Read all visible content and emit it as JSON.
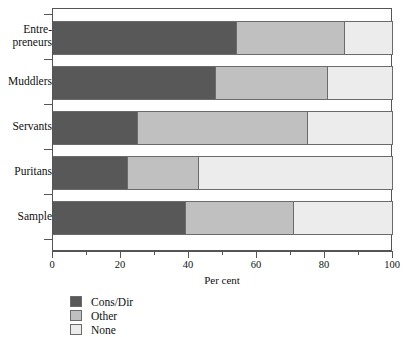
{
  "chart_data": {
    "type": "bar",
    "orientation": "horizontal",
    "stacked": true,
    "stacked_mode": "percent",
    "title": "",
    "xlabel": "Per cent",
    "ylabel": "",
    "xlim": [
      0,
      100
    ],
    "xticks": [
      0,
      20,
      40,
      60,
      80,
      100
    ],
    "xtick_labels": [
      "0",
      "20",
      "40",
      "60",
      "80",
      "100"
    ],
    "minor_xticks": [
      10,
      30,
      50,
      70,
      90
    ],
    "grid": false,
    "legend_position": "below-left",
    "categories": [
      "Entre-preneurs",
      "Muddlers",
      "Servants",
      "Puritans",
      "Sample"
    ],
    "series": [
      {
        "name": "Cons/Dir",
        "color": "#585858",
        "values": [
          54,
          48,
          25,
          22,
          39
        ]
      },
      {
        "name": "Other",
        "color": "#c0c0c0",
        "values": [
          32,
          33,
          50,
          21,
          32
        ]
      },
      {
        "name": "None",
        "color": "#ececec",
        "values": [
          14,
          19,
          25,
          57,
          29
        ]
      }
    ]
  },
  "axis": {
    "x_title": "Per cent",
    "tick_labels": [
      "0",
      "20",
      "40",
      "60",
      "80",
      "100"
    ]
  },
  "categories": [
    {
      "line1": "Entre-",
      "line2": "preneurs"
    },
    {
      "line1": "Muddlers",
      "line2": ""
    },
    {
      "line1": "Servants",
      "line2": ""
    },
    {
      "line1": "Puritans",
      "line2": ""
    },
    {
      "line1": "Sample",
      "line2": ""
    }
  ],
  "legend": {
    "items": [
      {
        "label": "Cons/Dir",
        "color": "#585858"
      },
      {
        "label": "Other",
        "color": "#c0c0c0"
      },
      {
        "label": "None",
        "color": "#ececec"
      }
    ]
  }
}
